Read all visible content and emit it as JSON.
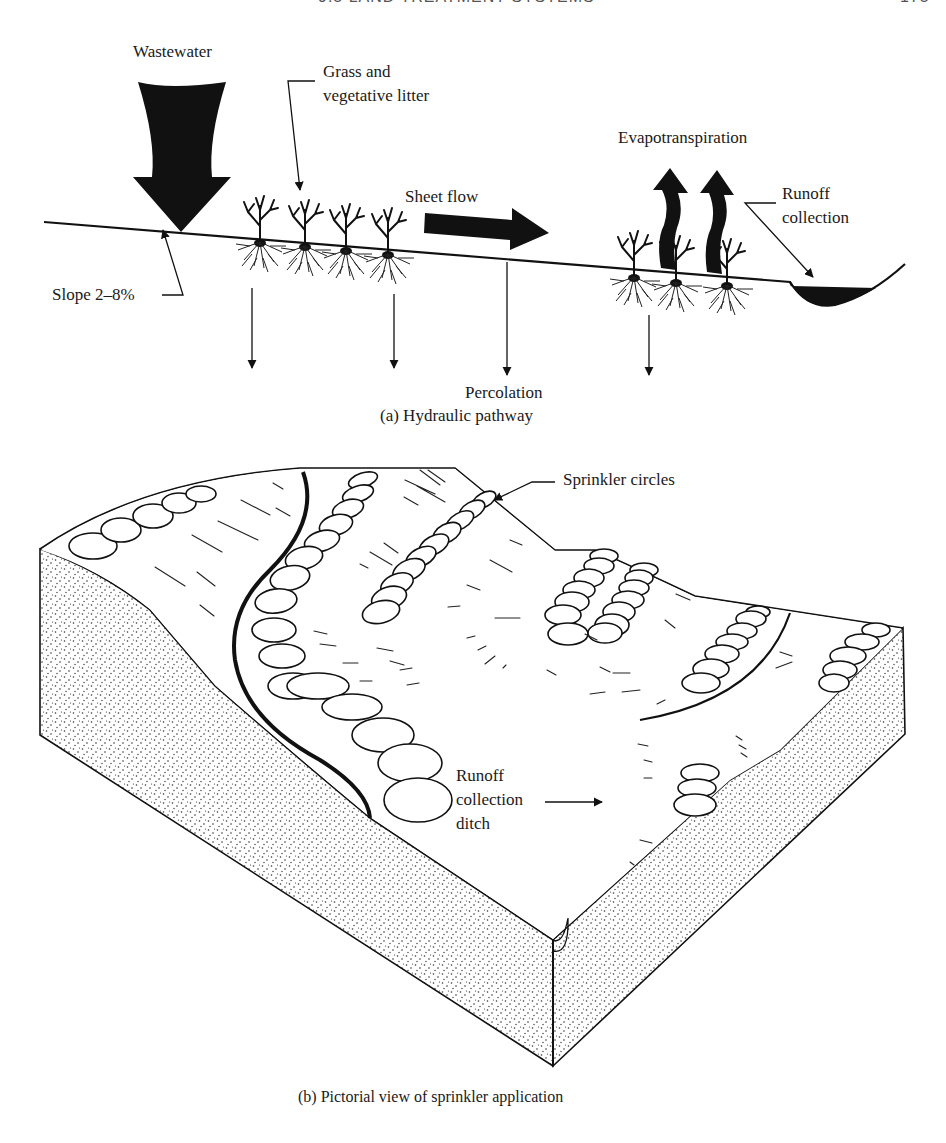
{
  "page_header": {
    "section": "9.5  LAND TREATMENT SYSTEMS",
    "page_number": "175"
  },
  "panel_a": {
    "caption": "(a) Hydraulic pathway",
    "labels": {
      "wastewater": "Wastewater",
      "grass_line1": "Grass and",
      "grass_line2": "vegetative litter",
      "sheet_flow": "Sheet flow",
      "evapotranspiration": "Evapotranspiration",
      "runoff_line1": "Runoff",
      "runoff_line2": "collection",
      "slope": "Slope 2–8%",
      "percolation": "Percolation"
    }
  },
  "panel_b": {
    "caption": "(b) Pictorial view of sprinkler application",
    "labels": {
      "sprinkler_circles": "Sprinkler circles",
      "ditch_line1": "Runoff",
      "ditch_line2": "collection",
      "ditch_line3": "ditch"
    }
  },
  "colors": {
    "ink": "#111111",
    "paper": "#ffffff",
    "stipple": "#333333"
  }
}
